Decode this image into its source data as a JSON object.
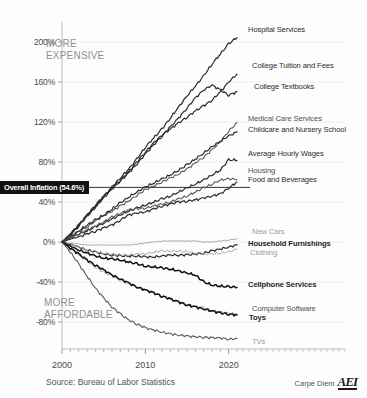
{
  "chart_data": {
    "type": "line",
    "title": "",
    "subtitle": "",
    "xlabel": "",
    "ylabel": "",
    "source": "Source: Bureau of Labor Statistics",
    "brand": "Carpe Diem",
    "brand_logo": "AEI",
    "xlim": [
      2000,
      2021
    ],
    "ylim": [
      -100,
      220
    ],
    "grid": true,
    "legend_position": "right-inline",
    "x_ticks": [
      "2000",
      "2010",
      "2020"
    ],
    "x_tick_values": [
      2000,
      2010,
      2020
    ],
    "y_ticks": [
      "200%",
      "160%",
      "120%",
      "80%",
      "40%",
      "0%",
      "-40%",
      "-80%"
    ],
    "y_tick_values": [
      200,
      160,
      120,
      80,
      40,
      0,
      -40,
      -80
    ],
    "reference_line": {
      "label": "Overall Inflation (54.6%)",
      "value": 54.6
    },
    "annotations": [
      {
        "id": "more-expensive",
        "text": "MORE\nEXPENSIVE"
      },
      {
        "id": "more-affordable",
        "text": "MORE\nAFFORDABLE"
      }
    ],
    "x": [
      2000,
      2001,
      2002,
      2003,
      2004,
      2005,
      2006,
      2007,
      2008,
      2009,
      2010,
      2011,
      2012,
      2013,
      2014,
      2015,
      2016,
      2017,
      2018,
      2019,
      2020,
      2021
    ],
    "series": [
      {
        "name": "Hospital Services",
        "end_value": 205,
        "style": "dark",
        "values": [
          0,
          7,
          16,
          26,
          35,
          45,
          55,
          64,
          73,
          83,
          95,
          104,
          113,
          124,
          135,
          146,
          156,
          166,
          178,
          188,
          198,
          205
        ]
      },
      {
        "name": "College Tuition and Fees",
        "end_value": 168,
        "style": "dark",
        "values": [
          0,
          8,
          17,
          27,
          37,
          46,
          54,
          62,
          70,
          80,
          90,
          99,
          107,
          113,
          119,
          125,
          131,
          136,
          142,
          150,
          160,
          168
        ]
      },
      {
        "name": "College Textbooks",
        "end_value": 150,
        "style": "dark",
        "values": [
          0,
          8,
          17,
          26,
          35,
          44,
          53,
          61,
          69,
          78,
          88,
          97,
          106,
          115,
          124,
          134,
          144,
          152,
          157,
          152,
          147,
          150
        ]
      },
      {
        "name": "Medical Care Services",
        "end_value": 119,
        "style": "mid",
        "values": [
          0,
          5,
          10,
          15,
          21,
          26,
          31,
          36,
          41,
          47,
          52,
          56,
          60,
          64,
          68,
          73,
          79,
          85,
          92,
          100,
          111,
          119
        ]
      },
      {
        "name": "Childcare and Nursery School",
        "end_value": 110,
        "style": "dark",
        "values": [
          0,
          5,
          11,
          17,
          22,
          27,
          33,
          39,
          45,
          50,
          55,
          59,
          63,
          67,
          72,
          77,
          83,
          89,
          95,
          101,
          106,
          110
        ]
      },
      {
        "name": "Average Hourly Wages",
        "end_value": 82,
        "style": "dark",
        "values": [
          0,
          4,
          8,
          11,
          15,
          19,
          23,
          27,
          31,
          34,
          37,
          40,
          43,
          46,
          50,
          54,
          58,
          62,
          67,
          72,
          82,
          82
        ]
      },
      {
        "name": "Housing",
        "end_value": 63,
        "style": "mid",
        "values": [
          0,
          4,
          8,
          12,
          16,
          20,
          25,
          29,
          32,
          33,
          34,
          36,
          38,
          40,
          43,
          46,
          50,
          54,
          58,
          62,
          63,
          63
        ]
      },
      {
        "name": "Food and Beverages",
        "end_value": 60,
        "style": "dark",
        "values": [
          0,
          3,
          5,
          8,
          11,
          14,
          17,
          22,
          27,
          29,
          30,
          33,
          36,
          38,
          40,
          41,
          42,
          44,
          46,
          48,
          54,
          60
        ]
      },
      {
        "name": "New Cars",
        "end_value": 3,
        "style": "light",
        "values": [
          0,
          -1,
          -2,
          -3,
          -3,
          -3,
          -3,
          -3,
          -3,
          -2,
          -1,
          0,
          1,
          1,
          1,
          1,
          1,
          0,
          0,
          1,
          2,
          3
        ]
      },
      {
        "name": "Household Furnishings",
        "end_value": -3,
        "style": "dark",
        "values": [
          0,
          -2,
          -5,
          -8,
          -10,
          -12,
          -13,
          -14,
          -14,
          -14,
          -15,
          -15,
          -14,
          -13,
          -13,
          -13,
          -12,
          -11,
          -9,
          -7,
          -5,
          -3
        ]
      },
      {
        "name": "Clothing",
        "end_value": -7,
        "style": "light",
        "values": [
          0,
          -2,
          -5,
          -8,
          -10,
          -11,
          -12,
          -13,
          -13,
          -12,
          -12,
          -10,
          -9,
          -9,
          -9,
          -10,
          -11,
          -12,
          -12,
          -11,
          -10,
          -7
        ]
      },
      {
        "name": "Cellphone Services",
        "end_value": -45,
        "style": "bold-dark",
        "values": [
          0,
          -4,
          -8,
          -11,
          -14,
          -16,
          -17,
          -18,
          -20,
          -22,
          -24,
          -25,
          -26,
          -27,
          -29,
          -31,
          -33,
          -40,
          -43,
          -44,
          -45,
          -45
        ]
      },
      {
        "name": "Computer Software",
        "end_value": -72,
        "style": "light",
        "values": [
          0,
          -6,
          -13,
          -19,
          -25,
          -30,
          -34,
          -38,
          -42,
          -45,
          -48,
          -51,
          -54,
          -57,
          -60,
          -62,
          -64,
          -66,
          -68,
          -70,
          -71,
          -72
        ]
      },
      {
        "name": "Toys",
        "end_value": -73,
        "style": "bold-dark",
        "values": [
          0,
          -6,
          -12,
          -18,
          -23,
          -28,
          -33,
          -37,
          -41,
          -45,
          -48,
          -51,
          -54,
          -57,
          -60,
          -63,
          -65,
          -67,
          -69,
          -71,
          -72,
          -73
        ]
      },
      {
        "name": "TVs",
        "end_value": -97,
        "style": "mid-light",
        "values": [
          0,
          -10,
          -22,
          -34,
          -46,
          -56,
          -65,
          -72,
          -78,
          -82,
          -86,
          -88,
          -90,
          -92,
          -93,
          -94,
          -95,
          -95,
          -96,
          -96,
          -97,
          -97
        ]
      }
    ],
    "series_labels": [
      {
        "name": "Hospital Services",
        "tone": "dark"
      },
      {
        "name": "College Tuition and Fees",
        "tone": "dark"
      },
      {
        "name": "College Textbooks",
        "tone": "dark"
      },
      {
        "name": "Medical Care Services",
        "tone": "mid"
      },
      {
        "name": "Childcare and Nursery School",
        "tone": "dark"
      },
      {
        "name": "Average Hourly Wages",
        "tone": "dark"
      },
      {
        "name": "Housing",
        "tone": "mid"
      },
      {
        "name": "Food and Beverages",
        "tone": "dark"
      },
      {
        "name": "New Cars",
        "tone": "light"
      },
      {
        "name": "Household Furnishings",
        "tone": "bold"
      },
      {
        "name": "Clothing",
        "tone": "light"
      },
      {
        "name": "Cellphone Services",
        "tone": "bold"
      },
      {
        "name": "Computer Software",
        "tone": "mid"
      },
      {
        "name": "Toys",
        "tone": "bold"
      },
      {
        "name": "TVs",
        "tone": "light"
      }
    ],
    "colors": {
      "dark": "#2b2b2b",
      "mid": "#5a5a5a",
      "light": "#a6a6a6",
      "axis": "#b0b0b0",
      "grid": "#ebebeb",
      "reference_badge_bg": "#111111",
      "reference_badge_fg": "#ffffff",
      "annotation": "#8f8f8f",
      "background": "#fdfdfd"
    }
  }
}
